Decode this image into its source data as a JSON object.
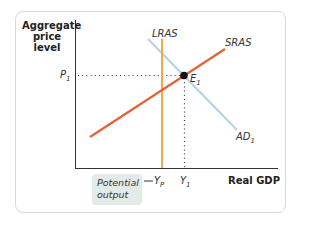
{
  "diagram": {
    "y_axis_title_lines": [
      "Aggregate",
      "price",
      "level"
    ],
    "x_axis_title": "Real GDP",
    "curves": {
      "lras": {
        "label": "LRAS",
        "color": "#f5a54a"
      },
      "sras": {
        "label": "SRAS",
        "color": "#e8603a"
      },
      "ad": {
        "label": "AD",
        "subscript": "1",
        "color": "#b8d3e6"
      }
    },
    "equilibrium": {
      "label": "E",
      "subscript": "1",
      "color": "#111111"
    },
    "price_label": {
      "label": "P",
      "subscript": "1"
    },
    "output_label": {
      "label": "Y",
      "subscript": "1"
    },
    "potential_output_label": {
      "label": "Y",
      "subscript": "P"
    },
    "callout": {
      "lines": [
        "Potential",
        "output"
      ],
      "background": "#e3ebe9"
    }
  }
}
